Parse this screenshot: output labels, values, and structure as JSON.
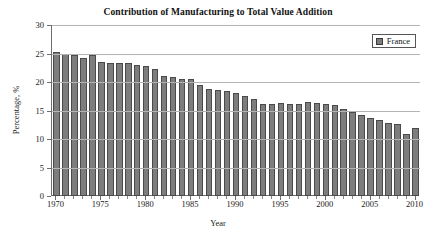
{
  "chart_data": {
    "type": "bar",
    "title": "Contribution of Manufacturing to Total Value Addition",
    "xlabel": "Year",
    "ylabel": "Percentage, %",
    "ylim": [
      0,
      30
    ],
    "ytick_step": 5,
    "yticks": [
      0,
      5,
      10,
      15,
      20,
      25,
      30
    ],
    "xlim": [
      1969.5,
      2010.5
    ],
    "xticks": [
      1970,
      1975,
      1980,
      1985,
      1990,
      1995,
      2000,
      2005,
      2010
    ],
    "grid": "horizontal",
    "legend_position": "top-right",
    "legend": [
      "France"
    ],
    "bar_color": "#7d7d7d",
    "bar_edge_color": "#4a4a4a",
    "axis_color": "#6e6e6e",
    "grid_color": "#b4b4b4",
    "categories": [
      "1970",
      "1971",
      "1972",
      "1973",
      "1974",
      "1975",
      "1976",
      "1977",
      "1978",
      "1979",
      "1980",
      "1981",
      "1982",
      "1983",
      "1984",
      "1985",
      "1986",
      "1987",
      "1988",
      "1989",
      "1990",
      "1991",
      "1992",
      "1993",
      "1994",
      "1995",
      "1996",
      "1997",
      "1998",
      "1999",
      "2000",
      "2001",
      "2002",
      "2003",
      "2004",
      "2005",
      "2006",
      "2007",
      "2008",
      "2009",
      "2010"
    ],
    "series": [
      {
        "name": "France",
        "values": [
          25.2,
          25.0,
          24.7,
          24.3,
          24.7,
          23.5,
          23.4,
          23.4,
          23.4,
          23.0,
          22.8,
          22.2,
          21.1,
          20.9,
          20.5,
          20.5,
          19.5,
          18.8,
          18.6,
          18.4,
          18.1,
          17.6,
          17.1,
          16.2,
          16.2,
          16.3,
          16.2,
          16.1,
          16.5,
          16.4,
          16.1,
          16.0,
          15.3,
          14.7,
          14.2,
          13.6,
          13.3,
          12.8,
          12.7,
          10.8,
          11.9
        ]
      }
    ]
  },
  "legend": {
    "france_label": "France",
    "swatch_name": "series-color-swatch"
  }
}
